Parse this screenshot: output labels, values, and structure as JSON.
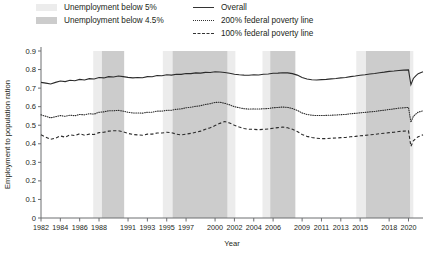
{
  "legend": {
    "left": [
      {
        "label": "Unemployment below 5%",
        "swatch": "#ececec",
        "name": "legend-band-below5"
      },
      {
        "label": "Unemployment below 4.5%",
        "swatch": "#cccccc",
        "name": "legend-band-below45"
      }
    ],
    "right": [
      {
        "label": "Overall",
        "style": "solid",
        "name": "legend-series-overall"
      },
      {
        "label": "200% federal poverty line",
        "style": "dotted",
        "name": "legend-series-200fpl"
      },
      {
        "label": "100% federal poverty line",
        "style": "dashed",
        "name": "legend-series-100fpl"
      }
    ]
  },
  "chart_data": {
    "type": "line",
    "title": "",
    "xlabel": "Year",
    "ylabel": "Employment to population ration",
    "xlim": [
      1982,
      2021.5
    ],
    "ylim": [
      0,
      0.9
    ],
    "ytick_step": 0.1,
    "grid": false,
    "legend_position": "top",
    "ytick_labels": [
      "0",
      "0.1",
      "0.2",
      "0.3",
      "0.4",
      "0.5",
      "0.6",
      "0.7",
      "0.8",
      "0.9"
    ],
    "xtick_labels": [
      "1982",
      "1984",
      "1986",
      "1988",
      "1991",
      "1993",
      "1995",
      "1997",
      "2000",
      "2002",
      "2004",
      "2006",
      "2009",
      "2011",
      "2013",
      "2015",
      "2018",
      "2020"
    ],
    "xtick_values": [
      1982,
      1984,
      1986,
      1988,
      1991,
      1993,
      1995,
      1997,
      2000,
      2002,
      2004,
      2006,
      2009,
      2011,
      2013,
      2015,
      2018,
      2020
    ],
    "shaded_bands": [
      {
        "label": "Unemployment below 5%",
        "color": "#ececec",
        "x0": 1987.4,
        "x1": 1988.3
      },
      {
        "label": "Unemployment below 4.5%",
        "color": "#cccccc",
        "x0": 1988.3,
        "x1": 1990.6
      },
      {
        "label": "Unemployment below 5%",
        "color": "#ececec",
        "x0": 1994.6,
        "x1": 1995.6
      },
      {
        "label": "Unemployment below 4.5%",
        "color": "#cccccc",
        "x0": 1995.6,
        "x1": 2001.3
      },
      {
        "label": "Unemployment below 5%",
        "color": "#ececec",
        "x0": 2001.3,
        "x1": 2002.1
      },
      {
        "label": "Unemployment below 5%",
        "color": "#ececec",
        "x0": 2004.9,
        "x1": 2005.7
      },
      {
        "label": "Unemployment below 4.5%",
        "color": "#cccccc",
        "x0": 2005.7,
        "x1": 2008.3
      },
      {
        "label": "Unemployment below 5%",
        "color": "#ececec",
        "x0": 2014.6,
        "x1": 2015.6
      },
      {
        "label": "Unemployment below 4.5%",
        "color": "#cccccc",
        "x0": 2015.6,
        "x1": 2020.2
      },
      {
        "label": "Unemployment below 5%",
        "color": "#ececec",
        "x0": 2020.2,
        "x1": 2020.5
      }
    ],
    "x": [
      1982.0,
      1982.5,
      1983.0,
      1983.5,
      1984.0,
      1984.5,
      1985.0,
      1985.5,
      1986.0,
      1986.5,
      1987.0,
      1987.5,
      1988.0,
      1988.5,
      1989.0,
      1989.5,
      1990.0,
      1990.5,
      1991.0,
      1991.5,
      1992.0,
      1992.5,
      1993.0,
      1993.5,
      1994.0,
      1994.5,
      1995.0,
      1995.5,
      1996.0,
      1996.5,
      1997.0,
      1997.5,
      1998.0,
      1998.5,
      1999.0,
      1999.5,
      2000.0,
      2000.5,
      2001.0,
      2001.5,
      2002.0,
      2002.5,
      2003.0,
      2003.5,
      2004.0,
      2004.5,
      2005.0,
      2005.5,
      2006.0,
      2006.5,
      2007.0,
      2007.5,
      2008.0,
      2008.5,
      2009.0,
      2009.5,
      2010.0,
      2010.5,
      2011.0,
      2011.5,
      2012.0,
      2012.5,
      2013.0,
      2013.5,
      2014.0,
      2014.5,
      2015.0,
      2015.5,
      2016.0,
      2016.5,
      2017.0,
      2017.5,
      2018.0,
      2018.5,
      2019.0,
      2019.5,
      2020.0,
      2020.25,
      2020.5,
      2020.75,
      2021.0,
      2021.5
    ],
    "series": [
      {
        "name": "Overall",
        "style": "solid",
        "values": [
          0.731,
          0.727,
          0.722,
          0.731,
          0.738,
          0.735,
          0.742,
          0.74,
          0.747,
          0.744,
          0.751,
          0.749,
          0.757,
          0.755,
          0.762,
          0.76,
          0.765,
          0.762,
          0.758,
          0.755,
          0.757,
          0.756,
          0.762,
          0.761,
          0.768,
          0.767,
          0.772,
          0.77,
          0.775,
          0.774,
          0.779,
          0.778,
          0.782,
          0.781,
          0.785,
          0.784,
          0.788,
          0.787,
          0.784,
          0.78,
          0.775,
          0.772,
          0.77,
          0.769,
          0.772,
          0.771,
          0.775,
          0.776,
          0.78,
          0.781,
          0.783,
          0.782,
          0.778,
          0.77,
          0.757,
          0.749,
          0.745,
          0.744,
          0.746,
          0.747,
          0.75,
          0.752,
          0.755,
          0.757,
          0.762,
          0.765,
          0.769,
          0.772,
          0.776,
          0.779,
          0.783,
          0.786,
          0.79,
          0.792,
          0.795,
          0.797,
          0.798,
          0.718,
          0.752,
          0.766,
          0.778,
          0.788
        ]
      },
      {
        "name": "200% federal poverty line",
        "style": "dotted",
        "values": [
          0.556,
          0.548,
          0.54,
          0.546,
          0.552,
          0.548,
          0.554,
          0.551,
          0.558,
          0.556,
          0.562,
          0.56,
          0.57,
          0.572,
          0.578,
          0.578,
          0.58,
          0.576,
          0.57,
          0.566,
          0.566,
          0.565,
          0.57,
          0.57,
          0.576,
          0.576,
          0.58,
          0.581,
          0.586,
          0.588,
          0.594,
          0.597,
          0.602,
          0.605,
          0.612,
          0.616,
          0.623,
          0.624,
          0.618,
          0.61,
          0.6,
          0.594,
          0.589,
          0.587,
          0.588,
          0.587,
          0.589,
          0.59,
          0.594,
          0.596,
          0.598,
          0.596,
          0.59,
          0.58,
          0.566,
          0.558,
          0.554,
          0.552,
          0.552,
          0.553,
          0.554,
          0.555,
          0.557,
          0.558,
          0.562,
          0.564,
          0.567,
          0.569,
          0.572,
          0.574,
          0.578,
          0.581,
          0.585,
          0.588,
          0.592,
          0.594,
          0.596,
          0.516,
          0.548,
          0.56,
          0.57,
          0.578
        ]
      },
      {
        "name": "100% federal poverty line",
        "style": "dashed",
        "values": [
          0.448,
          0.436,
          0.424,
          0.43,
          0.442,
          0.436,
          0.448,
          0.444,
          0.454,
          0.446,
          0.452,
          0.45,
          0.46,
          0.462,
          0.468,
          0.47,
          0.47,
          0.464,
          0.456,
          0.45,
          0.448,
          0.446,
          0.452,
          0.452,
          0.458,
          0.458,
          0.462,
          0.46,
          0.452,
          0.448,
          0.452,
          0.456,
          0.462,
          0.468,
          0.478,
          0.486,
          0.498,
          0.51,
          0.52,
          0.512,
          0.5,
          0.49,
          0.482,
          0.478,
          0.478,
          0.476,
          0.478,
          0.48,
          0.484,
          0.487,
          0.49,
          0.486,
          0.478,
          0.466,
          0.45,
          0.44,
          0.434,
          0.43,
          0.428,
          0.428,
          0.43,
          0.431,
          0.433,
          0.434,
          0.438,
          0.44,
          0.443,
          0.445,
          0.448,
          0.45,
          0.454,
          0.457,
          0.46,
          0.462,
          0.466,
          0.468,
          0.47,
          0.386,
          0.416,
          0.428,
          0.438,
          0.448
        ]
      }
    ]
  }
}
